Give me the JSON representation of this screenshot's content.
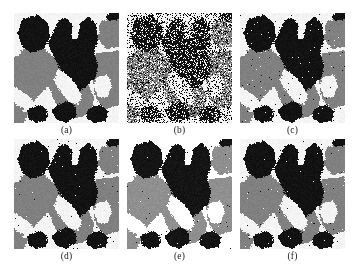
{
  "figure": {
    "name": "multi-panel-grayscale-segmentation-comparison",
    "rows": 2,
    "columns": 3,
    "panel_width_px": 105,
    "panel_height_px": 110,
    "background_color": "#ffffff"
  },
  "palette": {
    "black": "#121212",
    "gray": "#808080",
    "white": "#f4f4f2",
    "caption_color": "#1a1a1a"
  },
  "panels": [
    {
      "id": "a",
      "caption": "(a)",
      "description": "original three-level segmented image",
      "noise": "none",
      "noise_density": 0.0,
      "speckle_density": 0.0,
      "brightness": 1.0
    },
    {
      "id": "b",
      "caption": "(b)",
      "description": "noise corrupted image",
      "noise": "heavy-speckle",
      "noise_density": 0.42,
      "speckle_density": 0.42,
      "brightness": 1.0
    },
    {
      "id": "c",
      "caption": "(c)",
      "description": "restoration result with residual speckle",
      "noise": "light-speckle",
      "noise_density": 0.012,
      "speckle_density": 0.012,
      "brightness": 1.0
    },
    {
      "id": "d",
      "caption": "(d)",
      "description": "restoration result",
      "noise": "very-light-speckle",
      "noise_density": 0.006,
      "speckle_density": 0.006,
      "brightness": 1.0
    },
    {
      "id": "e",
      "caption": "(e)",
      "description": "restoration result, brighter tone",
      "noise": "very-light-speckle",
      "noise_density": 0.005,
      "speckle_density": 0.005,
      "brightness": 1.12
    },
    {
      "id": "f",
      "caption": "(f)",
      "description": "restoration result",
      "noise": "very-light-speckle",
      "noise_density": 0.006,
      "speckle_density": 0.006,
      "brightness": 1.0
    }
  ],
  "chart_data": {
    "type": "heatmap",
    "title": "",
    "xlabel": "",
    "ylabel": "",
    "levels": [
      {
        "name": "black",
        "value": 18,
        "color": "#121212"
      },
      {
        "name": "gray",
        "value": 128,
        "color": "#808080"
      },
      {
        "name": "white",
        "value": 244,
        "color": "#f4f4f2"
      }
    ],
    "canvas": {
      "width": 105,
      "height": 110
    },
    "regions": [
      {
        "level": "white",
        "comment": "base background layer covering whole field",
        "polygon": [
          [
            0,
            0
          ],
          [
            105,
            0
          ],
          [
            105,
            110
          ],
          [
            0,
            110
          ]
        ]
      },
      {
        "level": "gray",
        "comment": "broad mid-left diagonal gray band",
        "polygon": [
          [
            0,
            40
          ],
          [
            16,
            34
          ],
          [
            30,
            36
          ],
          [
            40,
            44
          ],
          [
            44,
            56
          ],
          [
            38,
            68
          ],
          [
            30,
            78
          ],
          [
            20,
            88
          ],
          [
            10,
            96
          ],
          [
            0,
            104
          ]
        ]
      },
      {
        "level": "gray",
        "comment": "large central-lower gray wedge running down-right",
        "polygon": [
          [
            30,
            48
          ],
          [
            46,
            44
          ],
          [
            58,
            52
          ],
          [
            66,
            62
          ],
          [
            74,
            72
          ],
          [
            80,
            84
          ],
          [
            78,
            96
          ],
          [
            68,
            104
          ],
          [
            56,
            106
          ],
          [
            46,
            98
          ],
          [
            40,
            86
          ],
          [
            34,
            72
          ],
          [
            28,
            60
          ]
        ]
      },
      {
        "level": "gray",
        "comment": "right-side gray block upper",
        "polygon": [
          [
            86,
            8
          ],
          [
            105,
            6
          ],
          [
            105,
            34
          ],
          [
            92,
            36
          ],
          [
            84,
            26
          ]
        ]
      },
      {
        "level": "gray",
        "comment": "right-side gray field lower",
        "polygon": [
          [
            82,
            40
          ],
          [
            105,
            38
          ],
          [
            105,
            92
          ],
          [
            92,
            96
          ],
          [
            82,
            86
          ],
          [
            78,
            64
          ]
        ]
      },
      {
        "level": "gray",
        "comment": "bottom-left small gray corner triangle",
        "polygon": [
          [
            0,
            96
          ],
          [
            14,
            100
          ],
          [
            10,
            110
          ],
          [
            0,
            110
          ]
        ]
      },
      {
        "level": "black",
        "comment": "upper-left black blob",
        "polygon": [
          [
            8,
            6
          ],
          [
            24,
            2
          ],
          [
            34,
            10
          ],
          [
            36,
            24
          ],
          [
            30,
            36
          ],
          [
            18,
            40
          ],
          [
            8,
            34
          ],
          [
            4,
            20
          ]
        ]
      },
      {
        "level": "black",
        "comment": "large central black mass with two upward prongs",
        "polygon": [
          [
            38,
            22
          ],
          [
            44,
            8
          ],
          [
            52,
            4
          ],
          [
            58,
            12
          ],
          [
            58,
            24
          ],
          [
            64,
            26
          ],
          [
            66,
            10
          ],
          [
            74,
            4
          ],
          [
            82,
            10
          ],
          [
            84,
            26
          ],
          [
            80,
            40
          ],
          [
            84,
            52
          ],
          [
            82,
            64
          ],
          [
            74,
            72
          ],
          [
            66,
            78
          ],
          [
            58,
            74
          ],
          [
            50,
            64
          ],
          [
            44,
            52
          ],
          [
            38,
            40
          ],
          [
            34,
            30
          ]
        ]
      },
      {
        "level": "black",
        "comment": "upper-right black corner patch",
        "polygon": [
          [
            96,
            0
          ],
          [
            105,
            0
          ],
          [
            105,
            6
          ],
          [
            96,
            8
          ],
          [
            92,
            4
          ]
        ]
      },
      {
        "level": "black",
        "comment": "lower-central black lobe",
        "polygon": [
          [
            44,
            92
          ],
          [
            54,
            88
          ],
          [
            62,
            94
          ],
          [
            62,
            104
          ],
          [
            52,
            110
          ],
          [
            42,
            106
          ],
          [
            38,
            98
          ]
        ]
      },
      {
        "level": "black",
        "comment": "lower-left black lobe",
        "polygon": [
          [
            14,
            96
          ],
          [
            26,
            92
          ],
          [
            34,
            98
          ],
          [
            32,
            108
          ],
          [
            22,
            110
          ],
          [
            14,
            106
          ]
        ]
      },
      {
        "level": "black",
        "comment": "lower-right black lobe",
        "polygon": [
          [
            74,
            96
          ],
          [
            86,
            92
          ],
          [
            94,
            98
          ],
          [
            92,
            108
          ],
          [
            80,
            110
          ],
          [
            72,
            104
          ]
        ]
      },
      {
        "level": "white",
        "comment": "white streak between central mass and gray wedge",
        "polygon": [
          [
            44,
            56
          ],
          [
            54,
            62
          ],
          [
            62,
            72
          ],
          [
            68,
            82
          ],
          [
            64,
            92
          ],
          [
            54,
            88
          ],
          [
            46,
            78
          ],
          [
            40,
            68
          ]
        ]
      },
      {
        "level": "white",
        "comment": "white notch between black prongs",
        "polygon": [
          [
            58,
            12
          ],
          [
            64,
            10
          ],
          [
            64,
            26
          ],
          [
            58,
            26
          ]
        ]
      },
      {
        "level": "white",
        "comment": "white pocket right of central mass",
        "polygon": [
          [
            82,
            64
          ],
          [
            94,
            62
          ],
          [
            98,
            72
          ],
          [
            94,
            84
          ],
          [
            84,
            84
          ],
          [
            80,
            74
          ]
        ]
      },
      {
        "level": "white",
        "comment": "white band lower-left of gray band",
        "polygon": [
          [
            0,
            74
          ],
          [
            14,
            82
          ],
          [
            24,
            92
          ],
          [
            14,
            96
          ],
          [
            2,
            92
          ],
          [
            0,
            88
          ]
        ]
      },
      {
        "level": "white",
        "comment": "white left-edge gap above gray band",
        "polygon": [
          [
            0,
            30
          ],
          [
            8,
            34
          ],
          [
            6,
            42
          ],
          [
            0,
            44
          ]
        ]
      }
    ]
  }
}
